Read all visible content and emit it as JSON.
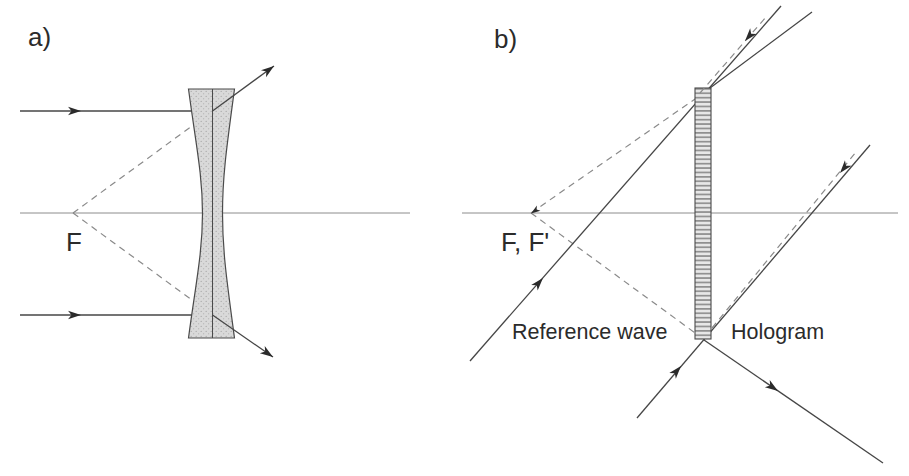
{
  "colors": {
    "ink": "#2b2b2b",
    "ray": "#464646",
    "axis": "#8c8c8c",
    "dashed": "#8a8a8a",
    "outline": "#4a4a4a",
    "lens-fill": "#d9d9d9",
    "hatch-dark": "#909090",
    "hatch-light": "#e7e7e7"
  },
  "panel_a": {
    "tag": "a)",
    "focal_label": "F"
  },
  "panel_b": {
    "tag": "b)",
    "focal_label": "F, F'",
    "reference_wave_label": "Reference wave",
    "hologram_label": "Hologram"
  }
}
